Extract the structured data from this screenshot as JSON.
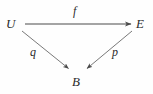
{
  "diagram": {
    "type": "commutative-diagram",
    "background_color": "#fefefe",
    "ink_color": "#2b2b2b",
    "line_color": "#555555",
    "nodes": [
      {
        "id": "U",
        "label": "U",
        "x": 13,
        "y": 24
      },
      {
        "id": "E",
        "label": "E",
        "x": 142,
        "y": 24
      },
      {
        "id": "B",
        "label": "B",
        "x": 78,
        "y": 82
      }
    ],
    "edges": [
      {
        "id": "f",
        "label": "f",
        "from": "U",
        "to": "E",
        "label_x": 77,
        "label_y": 12,
        "x1": 25,
        "y1": 24,
        "x2": 133,
        "y2": 24
      },
      {
        "id": "q",
        "label": "q",
        "from": "U",
        "to": "B",
        "label_x": 34,
        "label_y": 53,
        "x1": 22,
        "y1": 31,
        "x2": 70,
        "y2": 70
      },
      {
        "id": "p",
        "label": "p",
        "from": "E",
        "to": "B",
        "label_x": 116,
        "label_y": 53,
        "x1": 132,
        "y1": 31,
        "x2": 86,
        "y2": 70
      }
    ]
  }
}
